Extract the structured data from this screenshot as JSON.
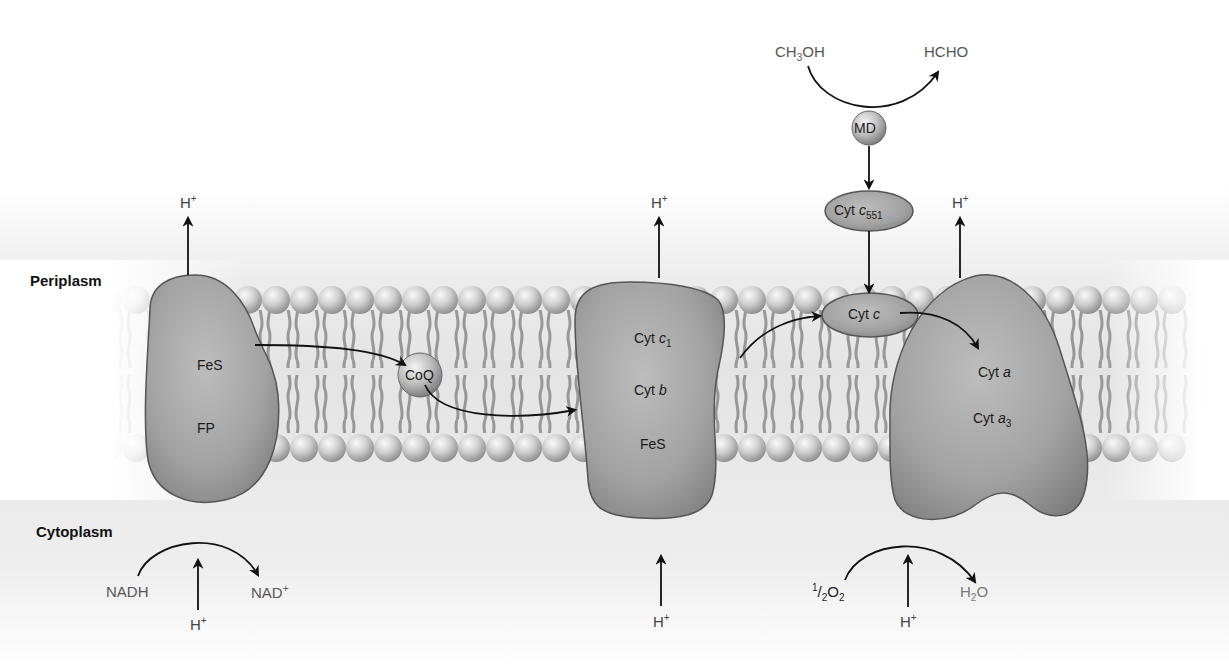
{
  "diagram": {
    "type": "electron-transport-chain",
    "regions": {
      "periplasm": "Periplasm",
      "cytoplasm": "Cytoplasm"
    },
    "complexes": [
      {
        "id": "complex-1",
        "labels": [
          "FeS",
          "FP"
        ]
      },
      {
        "id": "coq",
        "labels": [
          "CoQ"
        ]
      },
      {
        "id": "complex-3",
        "labels": [
          "Cyt c1",
          "Cyt b",
          "FeS"
        ]
      },
      {
        "id": "cyt-c",
        "labels": [
          "Cyt c"
        ]
      },
      {
        "id": "complex-4",
        "labels": [
          "Cyt a",
          "Cyt a3"
        ]
      }
    ],
    "methanol_branch": {
      "substrate": "CH3OH",
      "product": "HCHO",
      "enzyme": "MD",
      "carrier": "Cyt c551"
    },
    "reactions": {
      "nadh": "NADH",
      "nad": "NAD+",
      "oxygen": "1/2O2",
      "water": "H2O"
    },
    "protons": {
      "label": "H+",
      "out_count": 3,
      "in_count": 3
    },
    "colors": {
      "protein": "#9a9a9a",
      "protein_dark": "#6e6e6e",
      "membrane_head": "#c8c8c8",
      "arrow": "#111111",
      "chem_text": "#555555"
    }
  }
}
